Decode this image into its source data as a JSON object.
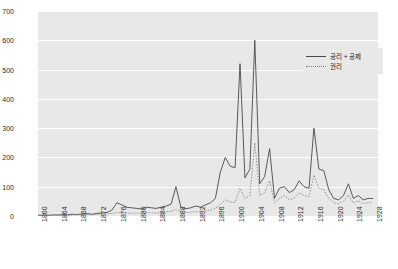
{
  "chart_data": {
    "type": "line",
    "title": "",
    "subtitle": "",
    "xlabel": "",
    "ylabel": "",
    "xlim": [
      1860,
      1929
    ],
    "ylim": [
      0,
      700
    ],
    "grid": true,
    "legend_position": "top-right",
    "panel_background": "#e8e8e8",
    "gridline_color": "#ffffff",
    "yticks": [
      0,
      100,
      200,
      300,
      400,
      500,
      600,
      700
    ],
    "ytick_labels": [
      "0",
      "100",
      "200",
      "300",
      "400",
      "500",
      "600",
      "700"
    ],
    "xticks": [
      1860,
      1864,
      1868,
      1872,
      1876,
      1880,
      1884,
      1888,
      1892,
      1896,
      1900,
      1904,
      1908,
      1912,
      1916,
      1920,
      1924,
      1928
    ],
    "xtick_labels": [
      "1860",
      "1864",
      "1868",
      "1872",
      "1876",
      "1880",
      "1884",
      "1888",
      "1892",
      "1896",
      "1900",
      "1904",
      "1908",
      "1912",
      "1916",
      "1920",
      "1924",
      "1928"
    ],
    "x": [
      1860,
      1861,
      1862,
      1863,
      1864,
      1865,
      1866,
      1867,
      1868,
      1869,
      1870,
      1871,
      1872,
      1873,
      1874,
      1875,
      1876,
      1877,
      1878,
      1879,
      1880,
      1881,
      1882,
      1883,
      1884,
      1885,
      1886,
      1887,
      1888,
      1889,
      1890,
      1891,
      1892,
      1893,
      1894,
      1895,
      1896,
      1897,
      1898,
      1899,
      1900,
      1901,
      1902,
      1903,
      1904,
      1905,
      1906,
      1907,
      1908,
      1909,
      1910,
      1911,
      1912,
      1913,
      1914,
      1915,
      1916,
      1917,
      1918,
      1919,
      1920,
      1921,
      1922,
      1923,
      1924,
      1925,
      1926,
      1927,
      1928
    ],
    "series": [
      {
        "name": "공리 + 공제",
        "style": "solid",
        "color": "#4a4a4a",
        "values": [
          2,
          3,
          2,
          4,
          3,
          5,
          4,
          6,
          5,
          7,
          8,
          6,
          9,
          10,
          12,
          20,
          45,
          38,
          30,
          28,
          26,
          24,
          30,
          28,
          26,
          30,
          34,
          40,
          100,
          30,
          25,
          28,
          34,
          30,
          38,
          45,
          60,
          150,
          200,
          170,
          165,
          520,
          130,
          160,
          600,
          110,
          135,
          230,
          60,
          95,
          100,
          80,
          90,
          120,
          100,
          95,
          300,
          160,
          155,
          90,
          60,
          55,
          70,
          110,
          60,
          70,
          55,
          60,
          60
        ]
      },
      {
        "name": "권리",
        "style": "dotted",
        "color": "#8a8a8a",
        "values": [
          1,
          1,
          2,
          2,
          3,
          2,
          3,
          3,
          4,
          4,
          5,
          4,
          6,
          6,
          7,
          9,
          12,
          11,
          10,
          9,
          10,
          9,
          12,
          11,
          10,
          12,
          14,
          16,
          22,
          14,
          12,
          13,
          15,
          14,
          17,
          20,
          26,
          40,
          55,
          48,
          46,
          95,
          60,
          70,
          250,
          70,
          80,
          120,
          45,
          60,
          70,
          55,
          62,
          80,
          70,
          66,
          140,
          95,
          90,
          60,
          45,
          42,
          50,
          72,
          45,
          52,
          42,
          46,
          45
        ]
      }
    ]
  }
}
